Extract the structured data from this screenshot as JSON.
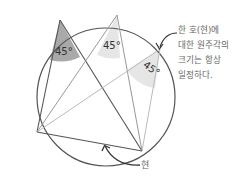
{
  "diagram": {
    "angles": [
      {
        "label": "45°",
        "shade": "#a9a9a9"
      },
      {
        "label": "45°",
        "shade": "#e6e6e6"
      },
      {
        "label": "45°",
        "shade": "#e6e6e6"
      }
    ],
    "annotation": {
      "lines": [
        "한 호(현)에",
        "대한 원주각의",
        "크기는 항상",
        "일정하다."
      ]
    },
    "chord_label": "현",
    "colors": {
      "circle": "#555555",
      "dark_line": "#555555",
      "light_line": "#aaaaaa",
      "text": "#666666"
    }
  }
}
